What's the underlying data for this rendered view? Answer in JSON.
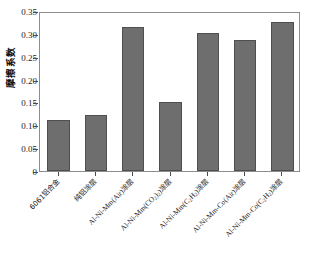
{
  "chart_data": {
    "type": "bar",
    "title": "",
    "xlabel": "",
    "ylabel": "摩擦系数",
    "ylim": [
      0,
      0.35
    ],
    "yticks": [
      "0",
      "0.05",
      "0.10",
      "0.15",
      "0.20",
      "0.25",
      "0.30",
      "0.35"
    ],
    "ytick_values": [
      0,
      0.05,
      0.1,
      0.15,
      0.2,
      0.25,
      0.3,
      0.35
    ],
    "grid": false,
    "legend": false,
    "bar_color": "#6e6e6e",
    "bar_edge_color": "#4f4f4f",
    "frame_color": "#8d8d8d",
    "categories": [
      "6061铝合金",
      "纯铝涂层",
      "Al-Ni-Mm(Air)涂层",
      "Al-Ni-Mm(CO2)涂层",
      "Al-Ni-Mm(C2H2)涂层",
      "Al-Ni-Mm-Co(Air)涂层",
      "Al-Ni-Mm-Co(C2H2)涂层"
    ],
    "values": [
      0.112,
      0.122,
      0.315,
      0.151,
      0.301,
      0.286,
      0.327
    ]
  },
  "axis": {
    "y_title": "摩擦系数",
    "y_ticklabels": [
      "0.35",
      "0.30",
      "0.25",
      "0.20",
      "0.15",
      "0.10",
      "0.05",
      "0"
    ],
    "x_ticklabels": [
      {
        "pre": "",
        "cjk1": "6061铝合金",
        "sub": "",
        "post": "",
        "cjk2": ""
      },
      {
        "pre": "",
        "cjk1": "纯铝涂层",
        "sub": "",
        "post": "",
        "cjk2": ""
      },
      {
        "pre": "Al-Ni-Mm(Air)",
        "cjk1": "",
        "sub": "",
        "post": "",
        "cjk2": "涂层"
      },
      {
        "pre": "Al-Ni-Mm(CO",
        "cjk1": "",
        "sub": "2",
        "post": ")",
        "cjk2": "涂层"
      },
      {
        "pre": "Al-Ni-Mm(C",
        "cjk1": "",
        "sub": "2",
        "post": "H",
        "cjk2": "涂层"
      },
      {
        "pre": "Al-Ni-Mm-Co(Air)",
        "cjk1": "",
        "sub": "",
        "post": "",
        "cjk2": "涂层"
      },
      {
        "pre": "Al-Ni-Mm-Co(C",
        "cjk1": "",
        "sub": "2",
        "post": "H",
        "cjk2": "涂层"
      }
    ]
  }
}
